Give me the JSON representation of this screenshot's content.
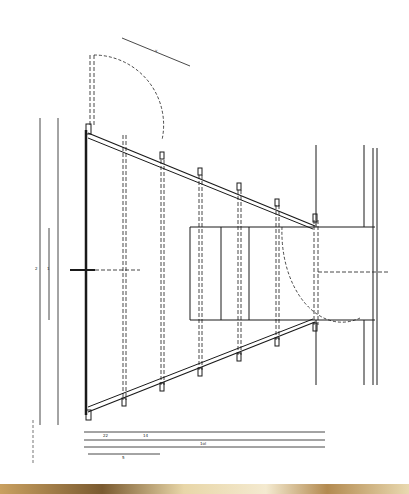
{
  "drawing": {
    "type": "architectural plan",
    "subject": "tapered stair/ramp plan with balustrade posts and door swing",
    "ink_color": "#1a1a1a",
    "paper_color": "#ffffff",
    "scan_edge_color": "#b38a50"
  },
  "dimensions": {
    "bottom_row_1": [
      "22",
      "14",
      "ol",
      "ol",
      "ol",
      "ol"
    ],
    "bottom_row_2": [
      "1ol"
    ],
    "bottom_row_3": [
      "5",
      "5",
      "ol"
    ],
    "bottom_row_4": [
      "5"
    ],
    "left_labels": [
      "2",
      "1",
      "4",
      "4"
    ],
    "top_label": "v"
  }
}
